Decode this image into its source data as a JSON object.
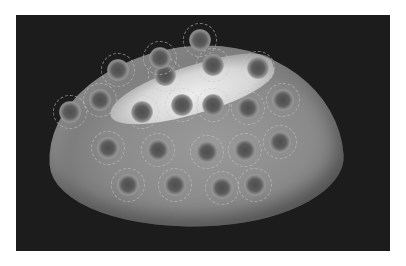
{
  "image": {
    "subject": "Petoskey stone (fossilized coral) photographed on a dark background",
    "colors": {
      "background_page": "#ffffff",
      "backdrop": "#1c1c1c",
      "stone_base": "#8a8a8a",
      "highlight": "#f2f2f2",
      "polyp_center": "#4e4e4e"
    },
    "spots": [
      {
        "x": 118,
        "y": 70
      },
      {
        "x": 165,
        "y": 75
      },
      {
        "x": 213,
        "y": 65
      },
      {
        "x": 258,
        "y": 68
      },
      {
        "x": 100,
        "y": 100
      },
      {
        "x": 142,
        "y": 112
      },
      {
        "x": 182,
        "y": 105
      },
      {
        "x": 213,
        "y": 105
      },
      {
        "x": 248,
        "y": 108
      },
      {
        "x": 283,
        "y": 100
      },
      {
        "x": 70,
        "y": 112
      },
      {
        "x": 108,
        "y": 148
      },
      {
        "x": 158,
        "y": 150
      },
      {
        "x": 207,
        "y": 152
      },
      {
        "x": 245,
        "y": 150
      },
      {
        "x": 280,
        "y": 142
      },
      {
        "x": 128,
        "y": 185
      },
      {
        "x": 175,
        "y": 185
      },
      {
        "x": 222,
        "y": 188
      },
      {
        "x": 255,
        "y": 185
      },
      {
        "x": 160,
        "y": 58
      },
      {
        "x": 200,
        "y": 40
      }
    ]
  }
}
